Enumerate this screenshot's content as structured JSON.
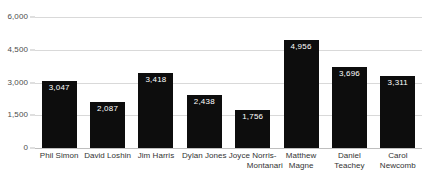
{
  "chart_data": {
    "type": "bar",
    "title": "",
    "subtitle": "",
    "xlabel": "",
    "ylabel": "",
    "categories": [
      "Phil Simon",
      "David Loshin",
      "Jim Harris",
      "Dylan Jones",
      "Joyce Norris-Montanari",
      "Matthew Magne",
      "Daniel Teachey",
      "Carol Newcomb"
    ],
    "category_lines": [
      [
        "Phil Simon"
      ],
      [
        "David Loshin"
      ],
      [
        "Jim Harris"
      ],
      [
        "Dylan Jones"
      ],
      [
        "Joyce Norris-",
        "Montanari"
      ],
      [
        "Matthew",
        "Magne"
      ],
      [
        "Daniel",
        "Teachey"
      ],
      [
        "Carol",
        "Newcomb"
      ]
    ],
    "values": [
      3047,
      2087,
      3418,
      2438,
      1756,
      4956,
      3696,
      3311
    ],
    "value_labels": [
      "3,047",
      "2,087",
      "3,418",
      "2,438",
      "1,756",
      "4,956",
      "3,696",
      "3,311"
    ],
    "ylim": [
      0,
      6000
    ],
    "yticks": [
      0,
      1500,
      3000,
      4500,
      6000
    ],
    "ytick_labels": [
      "0",
      "1,500",
      "3,000",
      "4,500",
      "6,000"
    ],
    "grid": true,
    "legend": "none",
    "bar_color": "#0d0d0d",
    "value_label_color": "#ffffff",
    "gridline_color": "#d9d9d9",
    "axis_text_color": "#4c4c4c"
  }
}
